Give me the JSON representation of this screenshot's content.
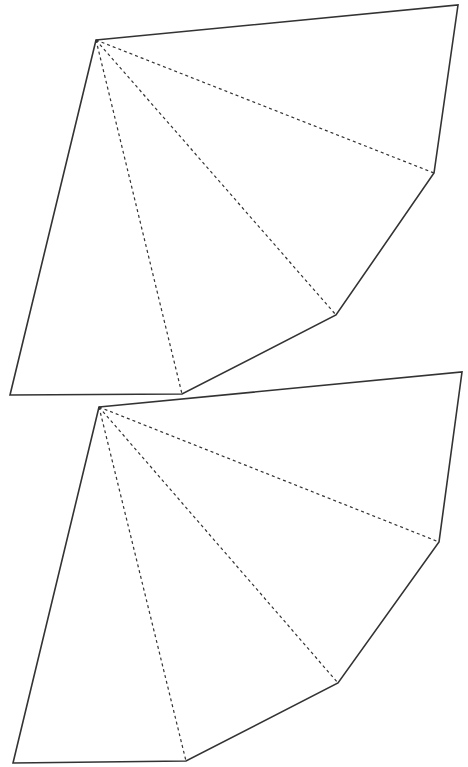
{
  "diagram": {
    "type": "fan-net",
    "background": "#ffffff",
    "stroke_color": "#333333",
    "shapes": [
      {
        "name": "upper-net",
        "apex": [
          96,
          40
        ],
        "outline": [
          [
            96,
            40
          ],
          [
            458,
            5
          ],
          [
            434,
            173
          ],
          [
            336,
            315
          ],
          [
            182,
            394
          ],
          [
            10,
            395
          ]
        ],
        "fold_lines_to": [
          [
            434,
            173
          ],
          [
            336,
            315
          ],
          [
            182,
            394
          ]
        ]
      },
      {
        "name": "lower-net",
        "apex": [
          99,
          407
        ],
        "outline": [
          [
            99,
            407
          ],
          [
            462,
            372
          ],
          [
            439,
            542
          ],
          [
            338,
            683
          ],
          [
            186,
            761
          ],
          [
            13,
            763
          ]
        ],
        "fold_lines_to": [
          [
            439,
            542
          ],
          [
            338,
            683
          ],
          [
            186,
            761
          ]
        ]
      }
    ]
  }
}
